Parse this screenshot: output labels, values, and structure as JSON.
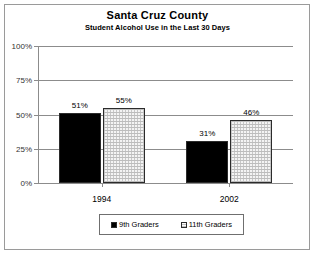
{
  "chart_data": {
    "type": "bar",
    "title": "Santa Cruz County",
    "subtitle": "Student Alcohol Use in the Last 30 Days",
    "xlabel": "",
    "ylabel": "",
    "categories": [
      "1994",
      "2002"
    ],
    "series": [
      {
        "name": "9th Graders",
        "values": [
          51,
          55
        ],
        "swatch": "black-filled-square"
      },
      {
        "name": "11th Graders",
        "values": [
          55,
          46
        ],
        "swatch": "dotted-white-square"
      }
    ],
    "series_correction": [
      {
        "name": "9th Graders",
        "values": [
          51,
          31
        ]
      },
      {
        "name": "11th Graders",
        "values": [
          55,
          46
        ]
      }
    ],
    "bar_labels": [
      {
        "category": "1994",
        "series": "9th Graders",
        "text": "51%",
        "value": 51
      },
      {
        "category": "1994",
        "series": "11th Graders",
        "text": "55%",
        "value": 55
      },
      {
        "category": "2002",
        "series": "9th Graders",
        "text": "31%",
        "value": 31
      },
      {
        "category": "2002",
        "series": "11th Graders",
        "text": "46%",
        "value": 46
      }
    ],
    "ylim": [
      0,
      100
    ],
    "yticks": [
      0,
      25,
      50,
      75,
      100
    ],
    "ytick_labels": [
      "0%",
      "25%",
      "50%",
      "75%",
      "100%"
    ],
    "grid": true,
    "grid_axis": "y",
    "legend_position": "bottom",
    "legend_entries": [
      "9th Graders",
      "11th Graders"
    ]
  },
  "legend": {
    "entries": [
      {
        "label": "9th Graders"
      },
      {
        "label": "11th Graders"
      }
    ]
  }
}
